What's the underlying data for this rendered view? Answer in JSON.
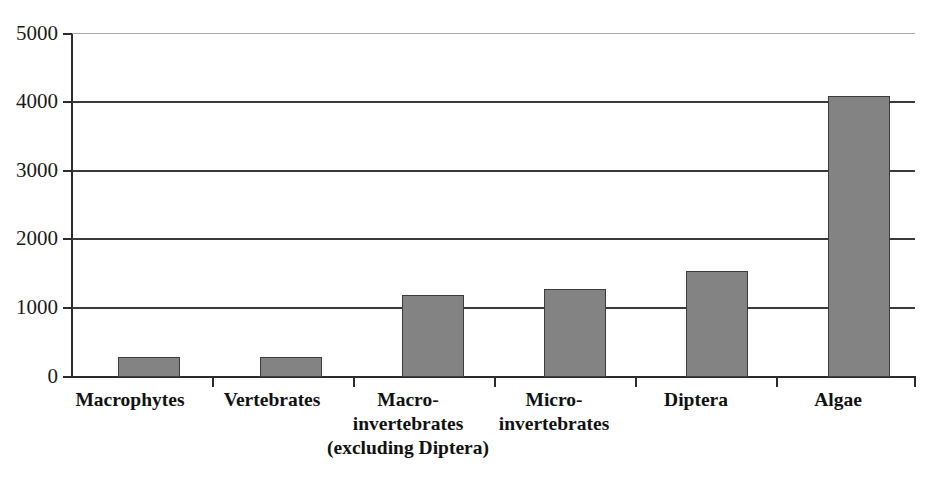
{
  "chart_data": {
    "type": "bar",
    "title": "",
    "subtitle": "",
    "xlabel": "",
    "ylabel": "",
    "categories": [
      "Macrophytes",
      "Vertebrates",
      "Macro-\ninvertebrates\n(excluding Diptera)",
      "Micro-\ninvertebrates",
      "Diptera",
      "Algae"
    ],
    "values": [
      290,
      285,
      1200,
      1280,
      1550,
      4090
    ],
    "ylim": [
      0,
      5000
    ],
    "yticks": [
      0,
      1000,
      2000,
      3000,
      4000,
      5000
    ],
    "ytick_labels": [
      "0",
      "1000",
      "2000",
      "3000",
      "4000",
      "5000"
    ],
    "grid": true,
    "grid_axis": "y",
    "legend": false,
    "legend_position": "none",
    "bar_fill_color": "#838383",
    "bar_edge_color": "#3c3c3c",
    "gridline_color": "#3a3a3a",
    "top_gridline_color": "#a8a8a8",
    "axis_color": "#2b2b2b",
    "background_color": "#ffffff"
  }
}
